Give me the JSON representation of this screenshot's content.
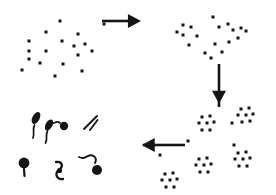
{
  "figure": {
    "name": "life-cycle-diagram",
    "type": "schematic",
    "background_color": "#ffffff",
    "ink_color": "#151515",
    "width": 276,
    "height": 195,
    "labels": []
  },
  "chart_data": {
    "type": "scatter",
    "title": "",
    "xlabel": "",
    "ylabel": "",
    "xlim": [
      0,
      276
    ],
    "ylim": [
      0,
      195
    ],
    "grid": false,
    "legend_position": "none",
    "marker": {
      "shape": "square",
      "color": "#151515",
      "size_px": 3
    },
    "panels": [
      {
        "name": "panel-top-left-dispersed",
        "stage": 1,
        "label": "",
        "point_count": 18,
        "points": [
          [
            29,
            41
          ],
          [
            29,
            51
          ],
          [
            29,
            59
          ],
          [
            22,
            70
          ],
          [
            46,
            32
          ],
          [
            46,
            51
          ],
          [
            40,
            63
          ],
          [
            55,
            76
          ],
          [
            60,
            21
          ],
          [
            62,
            41
          ],
          [
            63,
            64
          ],
          [
            74,
            46
          ],
          [
            78,
            34
          ],
          [
            78,
            55
          ],
          [
            82,
            71
          ],
          [
            85,
            44
          ],
          [
            92,
            51
          ],
          [
            104,
            24
          ]
        ]
      },
      {
        "name": "panel-top-right-aggregating",
        "stage": 2,
        "label": "",
        "point_count": 18,
        "points": [
          [
            183,
            25
          ],
          [
            177,
            32
          ],
          [
            183,
            35
          ],
          [
            191,
            27
          ],
          [
            197,
            36
          ],
          [
            189,
            45
          ],
          [
            213,
            17
          ],
          [
            215,
            44
          ],
          [
            219,
            27
          ],
          [
            228,
            24
          ],
          [
            233,
            30
          ],
          [
            241,
            28
          ],
          [
            246,
            31
          ],
          [
            238,
            38
          ],
          [
            229,
            42
          ],
          [
            222,
            52
          ],
          [
            205,
            53
          ],
          [
            211,
            58
          ]
        ]
      },
      {
        "name": "panel-bottom-right-clustered",
        "stage": 3,
        "label": "",
        "cluster_count": 6,
        "clusters": [
          {
            "name": "cluster-a",
            "center": [
              207,
              124
            ],
            "points": [
              [
                202,
                117
              ],
              [
                210,
                116
              ],
              [
                199,
                123
              ],
              [
                207,
                123
              ],
              [
                214,
                122
              ],
              [
                202,
                130
              ],
              [
                210,
                130
              ]
            ]
          },
          {
            "name": "cluster-b",
            "center": [
              246,
              116
            ],
            "points": [
              [
                241,
                109
              ],
              [
                249,
                108
              ],
              [
                238,
                115
              ],
              [
                246,
                115
              ],
              [
                253,
                114
              ],
              [
                242,
                122
              ],
              [
                250,
                121
              ]
            ]
          },
          {
            "name": "cluster-c",
            "center": [
              204,
              166
            ],
            "points": [
              [
                199,
                159
              ],
              [
                207,
                158
              ],
              [
                196,
                165
              ],
              [
                204,
                165
              ],
              [
                211,
                164
              ],
              [
                200,
                172
              ],
              [
                208,
                172
              ]
            ]
          },
          {
            "name": "cluster-d",
            "center": [
              243,
              160
            ],
            "points": [
              [
                238,
                153
              ],
              [
                246,
                152
              ],
              [
                235,
                159
              ],
              [
                243,
                159
              ],
              [
                250,
                158
              ],
              [
                239,
                166
              ],
              [
                247,
                166
              ]
            ]
          },
          {
            "name": "cluster-e",
            "center": [
              170,
              180
            ],
            "points": [
              [
                165,
                174
              ],
              [
                173,
                173
              ],
              [
                162,
                180
              ],
              [
                170,
                180
              ],
              [
                177,
                179
              ],
              [
                166,
                187
              ],
              [
                174,
                187
              ]
            ]
          },
          {
            "name": "cluster-singletons",
            "center": [
              0,
              0
            ],
            "points": [
              [
                232,
                123
              ],
              [
                234,
                145
              ],
              [
                188,
                141
              ],
              [
                160,
                155
              ]
            ]
          }
        ]
      },
      {
        "name": "panel-bottom-left-flagellates",
        "stage": 4,
        "label": "",
        "cell_count": 6,
        "cells": [
          {
            "name": "flagellate-1",
            "head": [
              36,
              118
            ],
            "orientation": "diagonal",
            "has_tail": true
          },
          {
            "name": "flagellate-2",
            "head": [
              48,
              126
            ],
            "orientation": "diagonal",
            "has_tail": true
          },
          {
            "name": "flagellate-3",
            "head": [
              62,
              126
            ],
            "orientation": "round",
            "has_tail": true
          },
          {
            "name": "flagellate-4",
            "head": [
              90,
              120
            ],
            "orientation": "double-stroke",
            "has_tail": false
          },
          {
            "name": "flagellate-5",
            "head": [
              24,
              164
            ],
            "orientation": "round",
            "has_tail": true
          },
          {
            "name": "flagellate-6",
            "head": [
              60,
              172
            ],
            "orientation": "squiggle",
            "has_tail": true
          },
          {
            "name": "flagellate-7",
            "head": [
              97,
              167
            ],
            "orientation": "round",
            "has_tail": true
          }
        ]
      }
    ],
    "arrows": [
      {
        "name": "arrow-right-top",
        "direction": "right",
        "from": [
          102,
          21
        ],
        "to": [
          138,
          21
        ],
        "stage_from": 1,
        "stage_to": 2
      },
      {
        "name": "arrow-down-right",
        "direction": "down",
        "from": [
          219,
          64
        ],
        "to": [
          219,
          107
        ],
        "stage_from": 2,
        "stage_to": 3
      },
      {
        "name": "arrow-left-bottom",
        "direction": "left",
        "from": [
          185,
          145
        ],
        "to": [
          143,
          145
        ],
        "stage_from": 3,
        "stage_to": 4
      }
    ]
  }
}
